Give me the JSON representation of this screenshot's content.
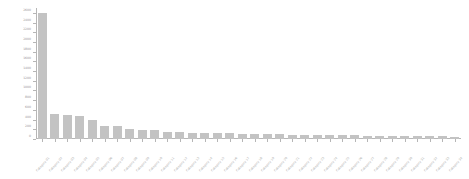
{
  "chart_data": {
    "type": "bar",
    "title": "",
    "xlabel": "",
    "ylabel": "",
    "ylim": [
      0,
      2700
    ],
    "grid": false,
    "legend": null,
    "bar_color": "#c3c3c3",
    "axis_color": "#b6b6b6",
    "tick_label_color": "#9a9a9a",
    "x_tick_rotation_deg": -48,
    "yticks": [
      0,
      200,
      400,
      600,
      800,
      1000,
      1200,
      1400,
      1600,
      1800,
      2000,
      2200,
      2400,
      2600
    ],
    "ytick_labels": [
      "0",
      "200",
      "400",
      "600",
      "800",
      "1000",
      "1200",
      "1400",
      "1600",
      "1800",
      "2000",
      "2200",
      "2400",
      "2600"
    ],
    "categories": [
      "Category 01",
      "Category 02",
      "Category 03",
      "Category 04",
      "Category 05",
      "Category 06",
      "Category 07",
      "Category 08",
      "Category 09",
      "Category 10",
      "Category 11",
      "Category 12",
      "Category 13",
      "Category 14",
      "Category 15",
      "Category 16",
      "Category 17",
      "Category 18",
      "Category 19",
      "Category 20",
      "Category 21",
      "Category 22",
      "Category 23",
      "Category 24",
      "Category 25",
      "Category 26",
      "Category 27",
      "Category 28",
      "Category 29",
      "Category 30",
      "Category 31",
      "Category 32",
      "Category 33",
      "Category 34"
    ],
    "values": [
      2600,
      510,
      500,
      480,
      390,
      270,
      265,
      215,
      185,
      180,
      150,
      145,
      130,
      125,
      120,
      115,
      110,
      105,
      100,
      95,
      90,
      88,
      85,
      82,
      78,
      75,
      72,
      70,
      66,
      62,
      58,
      55,
      52,
      48
    ]
  }
}
